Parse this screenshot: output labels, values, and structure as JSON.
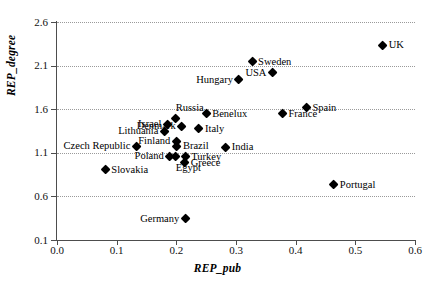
{
  "chart_data": {
    "type": "scatter",
    "title": "",
    "xlabel": "REP_pub",
    "ylabel": "REP_degree",
    "xlim": [
      0.0,
      0.6
    ],
    "ylim": [
      0.1,
      2.6
    ],
    "xticks": [
      "0.0",
      "0.1",
      "0.2",
      "0.3",
      "0.4",
      "0.5",
      "0.6"
    ],
    "yticks": [
      "0.1",
      "0.6",
      "1.1",
      "1.6",
      "2.1",
      "2.6"
    ],
    "grid": "horizontal-dotted",
    "legend": "none",
    "marker": "filled-diamond",
    "marker_color": "#000000",
    "points": [
      {
        "label": "UK",
        "x": 0.546,
        "y": 2.335,
        "pos": "lr"
      },
      {
        "label": "Sweden",
        "x": 0.327,
        "y": 2.145,
        "pos": "lr"
      },
      {
        "label": "USA",
        "x": 0.361,
        "y": 2.015,
        "pos": "ll"
      },
      {
        "label": "Hungary",
        "x": 0.305,
        "y": 1.935,
        "pos": "ll"
      },
      {
        "label": "Spain",
        "x": 0.418,
        "y": 1.615,
        "pos": "lr"
      },
      {
        "label": "France",
        "x": 0.378,
        "y": 1.545,
        "pos": "lr"
      },
      {
        "label": "Benelux",
        "x": 0.25,
        "y": 1.545,
        "pos": "lr"
      },
      {
        "label": "Russia",
        "x": 0.199,
        "y": 1.49,
        "pos": "lt"
      },
      {
        "label": "Denmark",
        "x": 0.209,
        "y": 1.405,
        "pos": "ll"
      },
      {
        "label": "Israel",
        "x": 0.185,
        "y": 1.425,
        "pos": "ll"
      },
      {
        "label": "Italy",
        "x": 0.238,
        "y": 1.375,
        "pos": "lr"
      },
      {
        "label": "Lithuania",
        "x": 0.18,
        "y": 1.345,
        "pos": "ll"
      },
      {
        "label": "Finland",
        "x": 0.2,
        "y": 1.23,
        "pos": "ll"
      },
      {
        "label": "Brazil",
        "x": 0.201,
        "y": 1.175,
        "pos": "lr"
      },
      {
        "label": "Czech Republic",
        "x": 0.133,
        "y": 1.175,
        "pos": "ll"
      },
      {
        "label": "India",
        "x": 0.283,
        "y": 1.165,
        "pos": "lr"
      },
      {
        "label": "Poland",
        "x": 0.189,
        "y": 1.06,
        "pos": "ll"
      },
      {
        "label": "Turkey",
        "x": 0.215,
        "y": 1.055,
        "pos": "lr"
      },
      {
        "label": "Greece",
        "x": 0.214,
        "y": 0.985,
        "pos": "lr"
      },
      {
        "label": "Egypt",
        "x": 0.199,
        "y": 1.06,
        "pos": "lb"
      },
      {
        "label": "Slovakia",
        "x": 0.081,
        "y": 0.905,
        "pos": "lr"
      },
      {
        "label": "Portugal",
        "x": 0.464,
        "y": 0.73,
        "pos": "lr"
      },
      {
        "label": "Germany",
        "x": 0.215,
        "y": 0.34,
        "pos": "ll"
      }
    ]
  }
}
